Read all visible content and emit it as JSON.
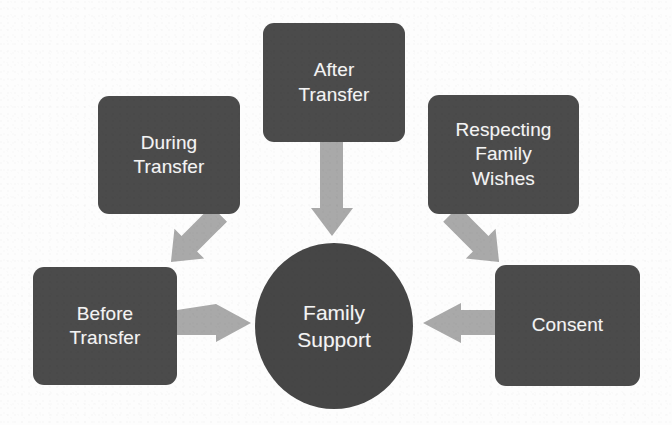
{
  "diagram": {
    "title": "Family Support",
    "type": "hub-and-spoke",
    "background_color": "#ffffff",
    "node_color": "#4b4b4b",
    "hub_color": "#464646",
    "arrow_color": "#a9a9a9",
    "text_color": "#f4f4f4",
    "hub": {
      "label": "Family\nSupport",
      "shape": "ellipse"
    },
    "nodes": [
      {
        "id": "after",
        "label": "After\nTransfer",
        "position": "top-center"
      },
      {
        "id": "during",
        "label": "During\nTransfer",
        "position": "top-left"
      },
      {
        "id": "respecting",
        "label": "Respecting\nFamily\nWishes",
        "position": "top-right"
      },
      {
        "id": "before",
        "label": "Before\nTransfer",
        "position": "middle-left"
      },
      {
        "id": "consent",
        "label": "Consent",
        "position": "middle-right"
      }
    ],
    "connections": [
      {
        "from": "after",
        "to": "hub",
        "direction": "down",
        "style": "block-arrow"
      },
      {
        "from": "during",
        "to": "hub",
        "direction": "down-right",
        "style": "block-arrow"
      },
      {
        "from": "respecting",
        "to": "hub",
        "direction": "down-left",
        "style": "block-arrow"
      },
      {
        "from": "before",
        "to": "hub",
        "direction": "right",
        "style": "block-arrow"
      },
      {
        "from": "consent",
        "to": "hub",
        "direction": "left",
        "style": "block-arrow"
      }
    ]
  }
}
